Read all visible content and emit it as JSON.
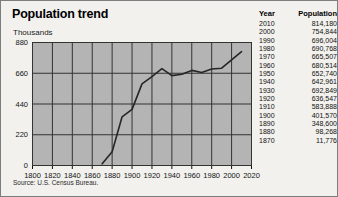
{
  "figure": {
    "title": "Population trend",
    "units_label": "Thousands",
    "source_note": "Source: U.S. Census Bureau."
  },
  "table": {
    "headers": {
      "year": "Year",
      "population": "Population"
    },
    "rows": [
      {
        "year": "2010",
        "population": "814,180"
      },
      {
        "year": "2000",
        "population": "754,844"
      },
      {
        "year": "1990",
        "population": "696,004"
      },
      {
        "year": "1980",
        "population": "690,768"
      },
      {
        "year": "1970",
        "population": "665,507"
      },
      {
        "year": "1960",
        "population": "680,514"
      },
      {
        "year": "1950",
        "population": "652,740"
      },
      {
        "year": "1940",
        "population": "642,961"
      },
      {
        "year": "1930",
        "population": "692,849"
      },
      {
        "year": "1920",
        "population": "636,547"
      },
      {
        "year": "1910",
        "population": "583,888"
      },
      {
        "year": "1900",
        "population": "401,570"
      },
      {
        "year": "1890",
        "population": "348,600"
      },
      {
        "year": "1880",
        "population": "98,268"
      },
      {
        "year": "1870",
        "population": "11,776"
      }
    ]
  },
  "colors": {
    "plot_background": "#b4b4b4",
    "gridline": "#333333",
    "series_line": "#262626",
    "axis": "#111111",
    "page_background": "#f2f1ee"
  },
  "chart_data": {
    "type": "line",
    "title": "Population trend",
    "xlabel": "",
    "ylabel": "Thousands",
    "grid": true,
    "legend": "none",
    "xlim": [
      1800,
      2020
    ],
    "ylim": [
      0,
      880
    ],
    "xticks": [
      1800,
      1820,
      1840,
      1860,
      1880,
      1900,
      1920,
      1940,
      1960,
      1980,
      2000,
      2020
    ],
    "yticks": [
      0,
      220,
      440,
      660,
      880
    ],
    "series": [
      {
        "name": "Population (thousands)",
        "x": [
          1870,
          1880,
          1890,
          1900,
          1910,
          1920,
          1930,
          1940,
          1950,
          1960,
          1970,
          1980,
          1990,
          2000,
          2010
        ],
        "values": [
          11.776,
          98.268,
          348.6,
          401.57,
          583.888,
          636.547,
          692.849,
          642.961,
          652.74,
          680.514,
          665.507,
          690.768,
          696.004,
          754.844,
          814.18
        ]
      }
    ]
  }
}
